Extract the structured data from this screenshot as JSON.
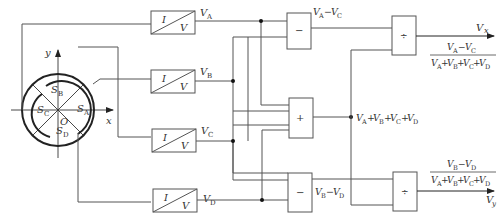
{
  "sensor": {
    "axis_x": "x",
    "axis_y": "y",
    "origin": "O",
    "electrodes": [
      {
        "id": "A",
        "label": "S",
        "sub": "A"
      },
      {
        "id": "B",
        "label": "S",
        "sub": "B"
      },
      {
        "id": "C",
        "label": "S",
        "sub": "C"
      },
      {
        "id": "D",
        "label": "S",
        "sub": "D"
      }
    ]
  },
  "converters": [
    {
      "in": "I",
      "out": "V",
      "signal": "V",
      "sub": "A"
    },
    {
      "in": "I",
      "out": "V",
      "signal": "V",
      "sub": "B"
    },
    {
      "in": "I",
      "out": "V",
      "signal": "V",
      "sub": "C"
    },
    {
      "in": "I",
      "out": "V",
      "signal": "V",
      "sub": "D"
    }
  ],
  "operators": {
    "subtract_top": "−",
    "adder": "+",
    "subtract_bottom": "−",
    "divide_top": "÷",
    "divide_bottom": "÷"
  },
  "signals": {
    "diff_x": {
      "a": "V",
      "a_sub": "A",
      "op": "−",
      "b": "V",
      "b_sub": "C"
    },
    "diff_y": {
      "a": "V",
      "a_sub": "B",
      "op": "−",
      "b": "V",
      "b_sub": "D"
    },
    "sum": {
      "terms": [
        "A",
        "B",
        "C",
        "D"
      ],
      "base": "V",
      "op": "+"
    }
  },
  "outputs": {
    "x": {
      "label": "V",
      "sub": "x",
      "numerator": "V_A − V_C",
      "denominator": "V_A + V_B + V_C + V_D"
    },
    "y": {
      "label": "V",
      "sub": "y",
      "numerator": "V_B − V_D",
      "denominator": "V_A + V_B + V_C + V_D"
    }
  }
}
